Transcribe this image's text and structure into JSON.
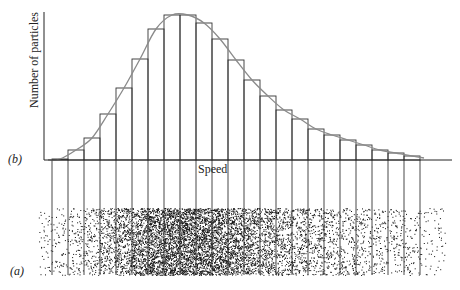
{
  "figure": {
    "panel_b_label": "(b)",
    "panel_a_label": "(a)",
    "y_axis_label": "Number of particles",
    "x_axis_label": "Speed",
    "colors": {
      "bars": "#333333",
      "curve": "#8a8a8a",
      "axis": "#222222",
      "dots": "#111111"
    }
  },
  "chart_data": {
    "type": "bar",
    "title": "",
    "xlabel": "Speed",
    "ylabel": "Number of particles",
    "bin_count": 23,
    "categories": [
      "1",
      "2",
      "3",
      "4",
      "5",
      "6",
      "7",
      "8",
      "9",
      "10",
      "11",
      "12",
      "13",
      "14",
      "15",
      "16",
      "17",
      "18",
      "19",
      "20",
      "21",
      "22",
      "23"
    ],
    "values": [
      1,
      10,
      22,
      46,
      72,
      101,
      131,
      145,
      145,
      137,
      121,
      100,
      80,
      64,
      50,
      41,
      31,
      25,
      20,
      15,
      10,
      7,
      4
    ],
    "value_units": "relative height (px, arbitrary units)",
    "ylim": [
      0,
      150
    ],
    "grid": false,
    "legend": null
  }
}
